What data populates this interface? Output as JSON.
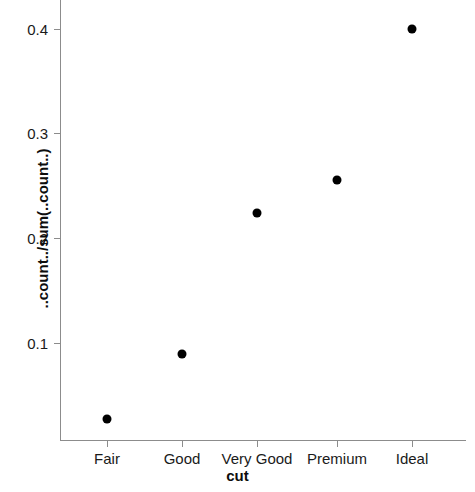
{
  "chart_data": {
    "type": "scatter",
    "title": "",
    "xlabel": "cut",
    "ylabel": "..count../sum(..count..)",
    "categories": [
      "Fair",
      "Good",
      "Very Good",
      "Premium",
      "Ideal"
    ],
    "values": [
      0.0295,
      0.0903,
      0.224,
      0.2557,
      0.4005
    ],
    "series": [
      {
        "name": "..count../sum(..count..)",
        "values": [
          0.0295,
          0.0903,
          0.224,
          0.2557,
          0.4005
        ]
      }
    ],
    "y_ticks": [
      0.1,
      0.2,
      0.3,
      0.4
    ],
    "y_tick_labels": [
      "0.1",
      "0.2",
      "0.3",
      "0.4"
    ],
    "x_tick_labels": [
      "Fair",
      "Good",
      "Very Good",
      "Premium",
      "Ideal"
    ],
    "ylim": [
      0.0,
      0.4281
    ],
    "grid": false,
    "legend": false,
    "marker": "filled-circle",
    "marker_color": "#000000",
    "axis_color": "#8c8c8c"
  },
  "points": [
    {
      "label": "Fair",
      "value": "0.0295",
      "cx": 107,
      "cy": 419
    },
    {
      "label": "Good",
      "value": "0.0903",
      "cx": 182,
      "cy": 354
    },
    {
      "label": "Very Good",
      "value": "0.2240",
      "cx": 257,
      "cy": 213
    },
    {
      "label": "Premium",
      "value": "0.2557",
      "cx": 337,
      "cy": 180
    },
    {
      "label": "Ideal",
      "value": "0.4005",
      "cx": 412,
      "cy": 29
    }
  ],
  "y_axis": {
    "title": "..count../sum(..count..)",
    "ticks": [
      {
        "label": "0.4",
        "y": 29
      },
      {
        "label": "0.3",
        "y": 133
      },
      {
        "label": "0.2",
        "y": 238
      },
      {
        "label": "0.1",
        "y": 343
      }
    ]
  },
  "x_axis": {
    "title": "cut",
    "ticks": [
      {
        "label": "Fair",
        "x": 107
      },
      {
        "label": "Good",
        "x": 182
      },
      {
        "label": "Very Good",
        "x": 257
      },
      {
        "label": "Premium",
        "x": 337
      },
      {
        "label": "Ideal",
        "x": 412
      }
    ]
  }
}
